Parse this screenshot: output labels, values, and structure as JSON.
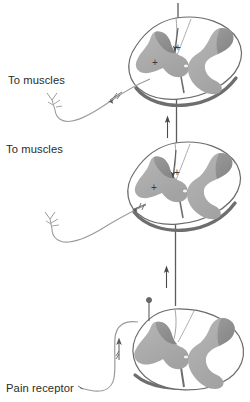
{
  "figure": {
    "name": "spinal-cord-pain-pathway",
    "background_color": "#ffffff",
    "ink_color": "#4a4a4a",
    "gray_matter_color": "#aeaeae",
    "gray_matter_dark_color": "#8f8f8f",
    "white_matter_color": "#ffffff",
    "outline_color": "#6b6b6b",
    "shadow_color": "#707070",
    "text_color": "#2b2b2b"
  },
  "labels": {
    "to_muscles_upper": "To muscles",
    "to_muscles_middle": "To muscles",
    "pain_receptor": "Pain receptor",
    "plus_sign": "+"
  },
  "sections": [
    {
      "id": "upper-cord-section",
      "name": "spinal-cord-section-upper",
      "orientation": "oblique",
      "synapse_markers": [
        "+",
        "+"
      ],
      "has_motor_output": true,
      "has_ascending_tract": true
    },
    {
      "id": "middle-cord-section",
      "name": "spinal-cord-section-middle",
      "orientation": "oblique",
      "synapse_markers": [
        "+",
        "+"
      ],
      "has_motor_output": true,
      "has_ascending_tract": true
    },
    {
      "id": "lower-cord-section",
      "name": "spinal-cord-section-lower",
      "orientation": "frontal",
      "synapse_markers": [],
      "has_motor_output": false,
      "has_ascending_tract": true,
      "has_dorsal_root_ganglion": true
    }
  ],
  "arrows": [
    {
      "name": "ascending-arrow-upper",
      "direction": "up",
      "on": "ascending-tract-line"
    },
    {
      "name": "ascending-arrow-middle",
      "direction": "up",
      "on": "ascending-tract-line"
    },
    {
      "name": "efferent-arrow-upper",
      "direction": "down-left",
      "on": "motor-fiber-upper"
    },
    {
      "name": "efferent-arrow-middle",
      "direction": "down-left",
      "on": "motor-fiber-middle"
    },
    {
      "name": "afferent-arrow-lower",
      "direction": "up",
      "on": "pain-fiber"
    }
  ]
}
